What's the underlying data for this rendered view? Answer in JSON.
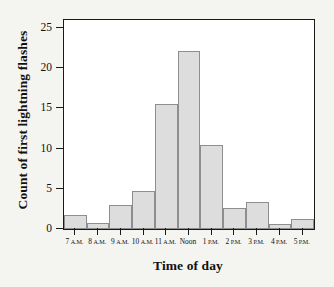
{
  "chart_data": {
    "type": "bar",
    "title": "",
    "xlabel": "Time of day",
    "ylabel": "Count of first lightning flashes",
    "categories": [
      "7 A.M.",
      "8 A.M.",
      "9 A.M.",
      "10 A.M.",
      "11 A.M.",
      "Noon",
      "1 P.M.",
      "2 P.M.",
      "3 P.M.",
      "4 P.M.",
      "5 P.M."
    ],
    "category_parts": [
      {
        "num": "7",
        "mer": "A.M."
      },
      {
        "num": "8",
        "mer": "A.M."
      },
      {
        "num": "9",
        "mer": "A.M."
      },
      {
        "num": "10",
        "mer": "A.M."
      },
      {
        "num": "11",
        "mer": "A.M."
      },
      {
        "num": "Noon",
        "mer": ""
      },
      {
        "num": "1",
        "mer": "P.M."
      },
      {
        "num": "2",
        "mer": "P.M."
      },
      {
        "num": "3",
        "mer": "P.M."
      },
      {
        "num": "4",
        "mer": "P.M."
      },
      {
        "num": "5",
        "mer": "P.M."
      }
    ],
    "values": [
      1.8,
      0.8,
      3.0,
      4.7,
      15.5,
      22.2,
      10.5,
      2.6,
      3.4,
      0.6,
      1.3
    ],
    "ylim": [
      0,
      26
    ],
    "yticks": [
      0,
      5,
      10,
      15,
      20,
      25
    ],
    "ytick_labels": [
      "0",
      "5",
      "10",
      "15",
      "20",
      "25"
    ],
    "grid": false,
    "legend": false,
    "bar_fill": "#dddddd",
    "bar_edge": "#8e8e8e",
    "axis_color": "#1a1a1a",
    "plot_background": "#ffffff",
    "figure_background": "#f4f4f0"
  }
}
